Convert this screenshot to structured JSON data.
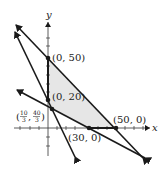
{
  "figure": {
    "type": "feasible-region-graph",
    "axes": {
      "x_label": "x",
      "y_label": "y"
    },
    "region_fill": "#e6e6e6",
    "line_color": "#1a1a1a",
    "vertices": [
      {
        "id": "v1",
        "label": "(0, 50)",
        "x": 0,
        "y": 50
      },
      {
        "id": "v2",
        "label": "(0, 20)",
        "x": 0,
        "y": 20
      },
      {
        "id": "v3",
        "label_open": "(",
        "label_num1": "10",
        "label_den1": "3",
        "label_sep": ",",
        "label_num2": "40",
        "label_den2": "3",
        "label_close": ")",
        "x": 3.333,
        "y": 13.333
      },
      {
        "id": "v4",
        "label": "(30, 0)",
        "x": 30,
        "y": 0
      },
      {
        "id": "v5",
        "label": "(50, 0)",
        "x": 50,
        "y": 0
      }
    ],
    "boundary_lines": [
      {
        "name": "line-through-0-50-and-50-0"
      },
      {
        "name": "steep-line-through-0-20"
      },
      {
        "name": "shallow-line-through-30-0"
      }
    ]
  }
}
